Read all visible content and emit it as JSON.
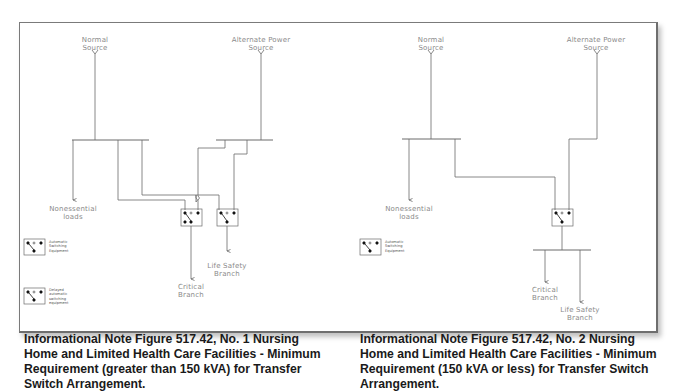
{
  "figures": [
    {
      "labels": {
        "normal_source": "Normal\nSource",
        "alternate_source": "Alternate Power\nSource",
        "nonessential": "Nonessential\nloads",
        "critical": "Critical\nBranch",
        "life_safety": "Life Safety\nBranch"
      },
      "legend": [
        {
          "label": "Automatic\nSwitching\nEquipment"
        },
        {
          "label": "Delayed\nautomatic\nswitching\nequipment"
        }
      ],
      "caption": "Informational Note Figure 517.42, No. 1 Nursing Home and Limited Health Care Facilities - Minimum Requirement (greater than 150 kVA) for Transfer Switch Arrangement."
    },
    {
      "labels": {
        "normal_source": "Normal\nSource",
        "alternate_source": "Alternate Power\nSource",
        "nonessential": "Nonessential\nloads",
        "critical": "Critical\nBranch",
        "life_safety": "Life Safety\nBranch"
      },
      "legend": [
        {
          "label": "Automatic\nSwitching\nEquipment"
        }
      ],
      "caption": "Informational Note Figure 517.42, No. 2 Nursing Home and Limited Health Care Facilities - Minimum Requirement (150 kVA or less) for Transfer Switch Arrangement."
    }
  ],
  "colors": {
    "line": "#6a6a6a",
    "label": "#8a8a8a",
    "caption": "#1a1a1a",
    "frame": "#7a7a7a"
  }
}
